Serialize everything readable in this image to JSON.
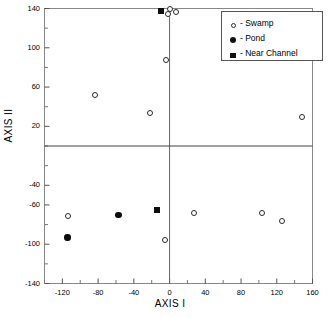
{
  "chart_data": {
    "type": "scatter",
    "title": "",
    "xlabel": "AXIS I",
    "ylabel": "AXIS II",
    "xlim": [
      -140,
      160
    ],
    "ylim": [
      -140,
      140
    ],
    "xticks": [
      -120,
      -80,
      -40,
      0,
      40,
      80,
      120,
      160
    ],
    "xtick_labels": [
      "-120",
      "-80",
      "-40",
      "0",
      "40",
      "80",
      "120",
      "160"
    ],
    "yticks": [
      140,
      100,
      60,
      20,
      -40,
      -60,
      -100,
      -140
    ],
    "ytick_labels": [
      "140",
      "100",
      "60",
      "20",
      "-40",
      "-60",
      "-100",
      "-140"
    ],
    "grid": false,
    "reference_lines": {
      "vertical_x": 0,
      "horizontal_y": 0
    },
    "legend": {
      "position": "top-right",
      "entries": [
        {
          "marker": "open-circle",
          "dash": "-",
          "label": "Swamp"
        },
        {
          "marker": "filled-circle",
          "dash": "-",
          "label": "Pond"
        },
        {
          "marker": "filled-square",
          "dash": "-",
          "label": "Near Channel"
        }
      ]
    },
    "series": [
      {
        "name": "Swamp",
        "marker": "open-circle",
        "color": "#ffffff",
        "edge_color": "#2a2a2a",
        "points": [
          {
            "x": 0,
            "y": 139
          },
          {
            "x": 7,
            "y": 136
          },
          {
            "x": -2,
            "y": 134
          },
          {
            "x": -4,
            "y": 88
          },
          {
            "x": -83,
            "y": 52
          },
          {
            "x": -22,
            "y": 34
          },
          {
            "x": 148,
            "y": 30
          },
          {
            "x": -114,
            "y": -71
          },
          {
            "x": 27,
            "y": -68
          },
          {
            "x": 103,
            "y": -68
          },
          {
            "x": 126,
            "y": -76
          },
          {
            "x": -5,
            "y": -96
          }
        ]
      },
      {
        "name": "Pond",
        "marker": "filled-circle",
        "color": "#0d0d0d",
        "edge_color": "#0d0d0d",
        "points": [
          {
            "x": -57,
            "y": -70
          },
          {
            "x": -114,
            "y": -93
          }
        ]
      },
      {
        "name": "Near Channel",
        "marker": "filled-square",
        "color": "#0d0d0d",
        "edge_color": "#0d0d0d",
        "points": [
          {
            "x": -10,
            "y": 137
          },
          {
            "x": -14,
            "y": -65
          }
        ]
      }
    ]
  }
}
